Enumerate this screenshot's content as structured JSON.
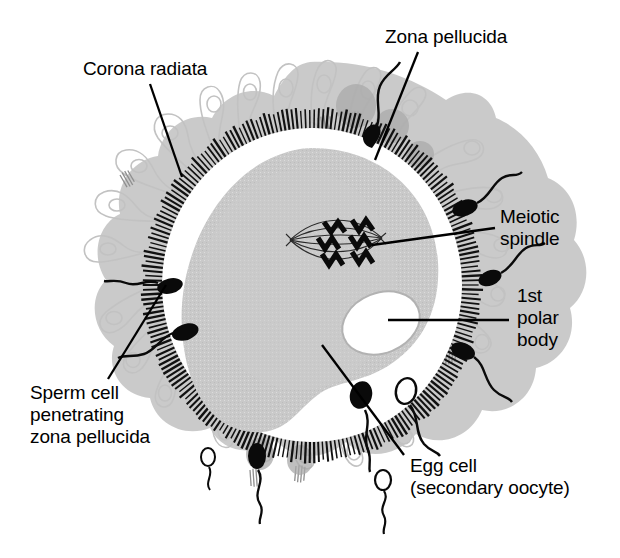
{
  "figure": {
    "width": 620,
    "height": 558,
    "background_color": "#ffffff",
    "line_color": "#000000"
  },
  "colors": {
    "cytoplasm_gray": "#c9c9c9",
    "corona_gray": "#bdbdbd",
    "corona_outline": "#c4c4c4",
    "perivitelline_white": "#ffffff",
    "zona_hatch": "#111111",
    "polar_body_outline": "#b2b2b2",
    "sperm_black": "#0a0a0a",
    "text_black": "#000000"
  },
  "labels": [
    {
      "id": "corona-radiata",
      "lines": [
        "Corona radiata"
      ],
      "x": 83,
      "y": 58,
      "leader": {
        "x1": 150,
        "y1": 84,
        "x2": 182,
        "y2": 177
      }
    },
    {
      "id": "zona-pellucida",
      "lines": [
        "Zona pellucida"
      ],
      "x": 385,
      "y": 26,
      "leader": {
        "x1": 418,
        "y1": 52,
        "x2": 375,
        "y2": 160
      }
    },
    {
      "id": "meiotic-spindle",
      "lines": [
        "Meiotic",
        "spindle"
      ],
      "x": 500,
      "y": 206,
      "leader": {
        "x1": 495,
        "y1": 228,
        "x2": 372,
        "y2": 245
      }
    },
    {
      "id": "first-polar-body",
      "lines": [
        "1st",
        "polar",
        "body"
      ],
      "x": 517,
      "y": 285,
      "leader": {
        "x1": 509,
        "y1": 320,
        "x2": 388,
        "y2": 320
      }
    },
    {
      "id": "sperm-cell-penetrating",
      "lines": [
        "Sperm cell",
        "penetrating",
        "zona pellucida"
      ],
      "x": 30,
      "y": 382,
      "leader": {
        "x1": 108,
        "y1": 379,
        "x2": 166,
        "y2": 285
      }
    },
    {
      "id": "egg-cell",
      "lines": [
        "Egg cell",
        "(secondary oocyte)"
      ],
      "x": 410,
      "y": 455,
      "leader": {
        "x1": 404,
        "y1": 455,
        "x2": 322,
        "y2": 345
      }
    }
  ],
  "structures": [
    {
      "id": "corona-radiata",
      "name": "Corona radiata",
      "description": "Ring of follicular cells radiating outward"
    },
    {
      "id": "zona-pellucida",
      "name": "Zona pellucida",
      "description": "Radially hatched glycoprotein shell"
    },
    {
      "id": "egg-cell",
      "name": "Egg cell (secondary oocyte)",
      "description": "Gray cytoplasm mass inside zona"
    },
    {
      "id": "meiotic-spindle",
      "name": "Meiotic spindle",
      "description": "Spindle fibers with dark chromosomes"
    },
    {
      "id": "first-polar-body",
      "name": "1st polar body",
      "description": "Small oval body in perivitelline space"
    },
    {
      "id": "sperm-cells",
      "name": "Sperm cells",
      "description": "Spermatozoa surrounding the oocyte"
    }
  ],
  "counts": {
    "sperm_total": 11,
    "sperm_penetrating": 3,
    "chromosome_pairs": 4
  }
}
